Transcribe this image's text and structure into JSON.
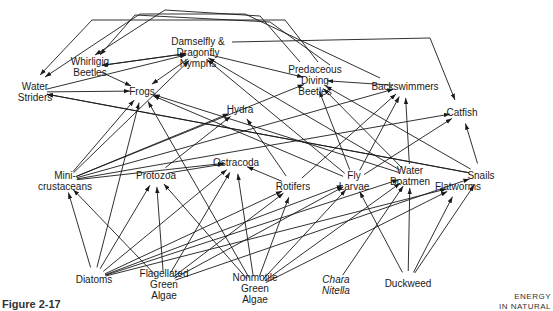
{
  "figure": {
    "caption": "Figure 2-17",
    "running_head": [
      "ENERGY",
      "IN NATURAL"
    ]
  },
  "nodes": {
    "water_striders": {
      "lines": [
        "Water",
        "Striders"
      ],
      "x": 35,
      "y": 92
    },
    "whirligig_beetles": {
      "lines": [
        "Whirligig",
        "Beetles"
      ],
      "x": 90,
      "y": 67
    },
    "nymphs": {
      "lines": [
        "Damselfly &",
        "Dragonfly",
        "Nymphs"
      ],
      "x": 198,
      "y": 52
    },
    "frogs": {
      "lines": [
        "Frogs"
      ],
      "x": 142,
      "y": 91
    },
    "predaceous_diving_beetles": {
      "lines": [
        "Predaceous",
        "Diving",
        "Beetles"
      ],
      "x": 315,
      "y": 80
    },
    "backswimmers": {
      "lines": [
        "Backswimmers"
      ],
      "x": 405,
      "y": 86
    },
    "catfish": {
      "lines": [
        "Catfish"
      ],
      "x": 462,
      "y": 112
    },
    "hydra": {
      "lines": [
        "Hydra"
      ],
      "x": 240,
      "y": 109
    },
    "mini_crustaceans": {
      "lines": [
        "Mini-",
        "crustaceans"
      ],
      "x": 65,
      "y": 181
    },
    "protozoa": {
      "lines": [
        "Protozoa"
      ],
      "x": 156,
      "y": 175
    },
    "ostracoda": {
      "lines": [
        "Ostracoda"
      ],
      "x": 236,
      "y": 162
    },
    "rotifers": {
      "lines": [
        "Rotifers"
      ],
      "x": 293,
      "y": 186
    },
    "fly_larvae": {
      "lines": [
        "Fly",
        "Larvae"
      ],
      "x": 354,
      "y": 181
    },
    "water_boatmen": {
      "lines": [
        "Water",
        "Boatmen"
      ],
      "x": 410,
      "y": 176
    },
    "flatworms": {
      "lines": [
        "Flatworms"
      ],
      "x": 458,
      "y": 186
    },
    "snails": {
      "lines": [
        "Snails"
      ],
      "x": 481,
      "y": 175
    },
    "diatoms": {
      "lines": [
        "Diatoms"
      ],
      "x": 94,
      "y": 279
    },
    "flagellated_green_algae": {
      "lines": [
        "Flagellated",
        "Green",
        "Algae"
      ],
      "x": 164,
      "y": 284
    },
    "nonmotile_green_algae": {
      "lines": [
        "Nonmotile",
        "Green",
        "Algae"
      ],
      "x": 255,
      "y": 288
    },
    "chara_nitella": {
      "lines": [
        "Chara",
        "Nitella"
      ],
      "x": 336,
      "y": 285,
      "italic": true
    },
    "duckweed": {
      "lines": [
        "Duckweed"
      ],
      "x": 408,
      "y": 283
    }
  },
  "edges": [
    {
      "from": "whirligig_beetles",
      "to": "nymphs"
    },
    {
      "from": "nymphs",
      "to": "whirligig_beetles"
    },
    {
      "from": "whirligig_beetles",
      "to": "frogs"
    },
    {
      "from": "water_striders",
      "to": "frogs"
    },
    {
      "from": "water_striders",
      "to": "nymphs"
    },
    {
      "from": "nymphs",
      "to": "frogs"
    },
    {
      "from": "nymphs",
      "to": "predaceous_diving_beetles"
    },
    {
      "from": "backswimmers",
      "to": "predaceous_diving_beetles"
    },
    {
      "from": "mini_crustaceans",
      "to": "frogs"
    },
    {
      "from": "mini_crustaceans",
      "to": "nymphs"
    },
    {
      "from": "mini_crustaceans",
      "to": "hydra"
    },
    {
      "from": "mini_crustaceans",
      "to": "ostracoda"
    },
    {
      "from": "mini_crustaceans",
      "to": "backswimmers"
    },
    {
      "from": "mini_crustaceans",
      "to": "catfish"
    },
    {
      "from": "mini_crustaceans",
      "to": "predaceous_diving_beetles"
    },
    {
      "from": "protozoa",
      "to": "ostracoda"
    },
    {
      "from": "protozoa",
      "to": "hydra"
    },
    {
      "from": "rotifers",
      "to": "ostracoda"
    },
    {
      "from": "rotifers",
      "to": "hydra"
    },
    {
      "from": "rotifers",
      "to": "backswimmers"
    },
    {
      "from": "fly_larvae",
      "to": "frogs"
    },
    {
      "from": "fly_larvae",
      "to": "nymphs"
    },
    {
      "from": "fly_larvae",
      "to": "predaceous_diving_beetles"
    },
    {
      "from": "fly_larvae",
      "to": "backswimmers"
    },
    {
      "from": "fly_larvae",
      "to": "catfish"
    },
    {
      "from": "water_boatmen",
      "to": "nymphs"
    },
    {
      "from": "water_boatmen",
      "to": "frogs"
    },
    {
      "from": "water_boatmen",
      "to": "predaceous_diving_beetles"
    },
    {
      "from": "water_boatmen",
      "to": "backswimmers"
    },
    {
      "from": "snails",
      "to": "water_striders"
    },
    {
      "from": "snails",
      "to": "catfish"
    },
    {
      "from": "snails",
      "to": "predaceous_diving_beetles"
    },
    {
      "from": "snails",
      "to": "water_striders"
    },
    {
      "from": "diatoms",
      "to": "mini_crustaceans"
    },
    {
      "from": "diatoms",
      "to": "frogs"
    },
    {
      "from": "diatoms",
      "to": "protozoa"
    },
    {
      "from": "diatoms",
      "to": "ostracoda"
    },
    {
      "from": "diatoms",
      "to": "rotifers"
    },
    {
      "from": "diatoms",
      "to": "fly_larvae"
    },
    {
      "from": "diatoms",
      "to": "water_boatmen"
    },
    {
      "from": "diatoms",
      "to": "flatworms"
    },
    {
      "from": "flagellated_green_algae",
      "to": "mini_crustaceans"
    },
    {
      "from": "flagellated_green_algae",
      "to": "protozoa"
    },
    {
      "from": "flagellated_green_algae",
      "to": "ostracoda"
    },
    {
      "from": "flagellated_green_algae",
      "to": "rotifers"
    },
    {
      "from": "flagellated_green_algae",
      "to": "fly_larvae"
    },
    {
      "from": "flagellated_green_algae",
      "to": "snails"
    },
    {
      "from": "nonmotile_green_algae",
      "to": "frogs"
    },
    {
      "from": "nonmotile_green_algae",
      "to": "protozoa"
    },
    {
      "from": "nonmotile_green_algae",
      "to": "ostracoda"
    },
    {
      "from": "nonmotile_green_algae",
      "to": "rotifers"
    },
    {
      "from": "nonmotile_green_algae",
      "to": "fly_larvae"
    },
    {
      "from": "nonmotile_green_algae",
      "to": "water_boatmen"
    },
    {
      "from": "nonmotile_green_algae",
      "to": "flatworms"
    },
    {
      "from": "chara_nitella",
      "to": "water_boatmen"
    },
    {
      "from": "duckweed",
      "to": "fly_larvae"
    },
    {
      "from": "duckweed",
      "to": "water_boatmen"
    },
    {
      "from": "duckweed",
      "to": "flatworms"
    },
    {
      "from": "duckweed",
      "to": "snails"
    }
  ],
  "overhead_paths": [
    {
      "label": "predaceous-to-water-striders",
      "points": [
        [
          318,
          62
        ],
        [
          285,
          20
        ],
        [
          92,
          20
        ],
        [
          40,
          75
        ]
      ]
    },
    {
      "label": "backswimmers-to-water-striders",
      "points": [
        [
          380,
          78
        ],
        [
          245,
          14
        ],
        [
          140,
          14
        ],
        [
          45,
          77
        ]
      ]
    },
    {
      "label": "predaceous-to-whirligig",
      "points": [
        [
          300,
          62
        ],
        [
          260,
          16
        ],
        [
          165,
          10
        ],
        [
          95,
          55
        ]
      ]
    },
    {
      "label": "nymphs-to-catfish",
      "points": [
        [
          232,
          42
        ],
        [
          430,
          38
        ],
        [
          455,
          100
        ]
      ]
    },
    {
      "label": "beetles-to-whirligig",
      "points": [
        [
          330,
          65
        ],
        [
          270,
          22
        ],
        [
          135,
          15
        ],
        [
          100,
          55
        ]
      ]
    }
  ]
}
